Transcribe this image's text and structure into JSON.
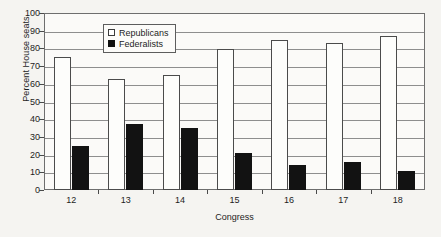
{
  "chart_data": {
    "type": "bar",
    "title": "",
    "xlabel": "Congress",
    "ylabel": "Percent House seats",
    "categories": [
      "12",
      "13",
      "14",
      "15",
      "16",
      "17",
      "18"
    ],
    "ylim": [
      0,
      100
    ],
    "yticks": [
      0,
      10,
      20,
      30,
      40,
      50,
      60,
      70,
      80,
      90,
      100
    ],
    "ytick_labels": [
      "0",
      "10",
      "20",
      "30",
      "40",
      "50",
      "60",
      "70",
      "80",
      "90",
      "100"
    ],
    "grid": true,
    "grid_axis": "y",
    "legend_position": "upper-center-left",
    "series": [
      {
        "name": "Republicans",
        "color": "#ffffff",
        "edge_color": "#4b4b4b",
        "values": [
          75,
          62.5,
          65,
          79.5,
          85,
          83,
          87
        ]
      },
      {
        "name": "Federalists",
        "color": "#121212",
        "edge_color": "#121212",
        "values": [
          25,
          37.5,
          35,
          21,
          14,
          16,
          11
        ]
      }
    ]
  },
  "legend": {
    "entries": [
      {
        "label": "Republicans",
        "swatch": "hollow-square-swatch"
      },
      {
        "label": "Federalists",
        "swatch": "filled-square-swatch"
      }
    ]
  },
  "colors": {
    "background": "#f5f4f1",
    "plot_background": "#fbfaf8",
    "axis": "#6e6e6e",
    "gridline": "#8e8e8e",
    "text": "#1d1d1d"
  }
}
